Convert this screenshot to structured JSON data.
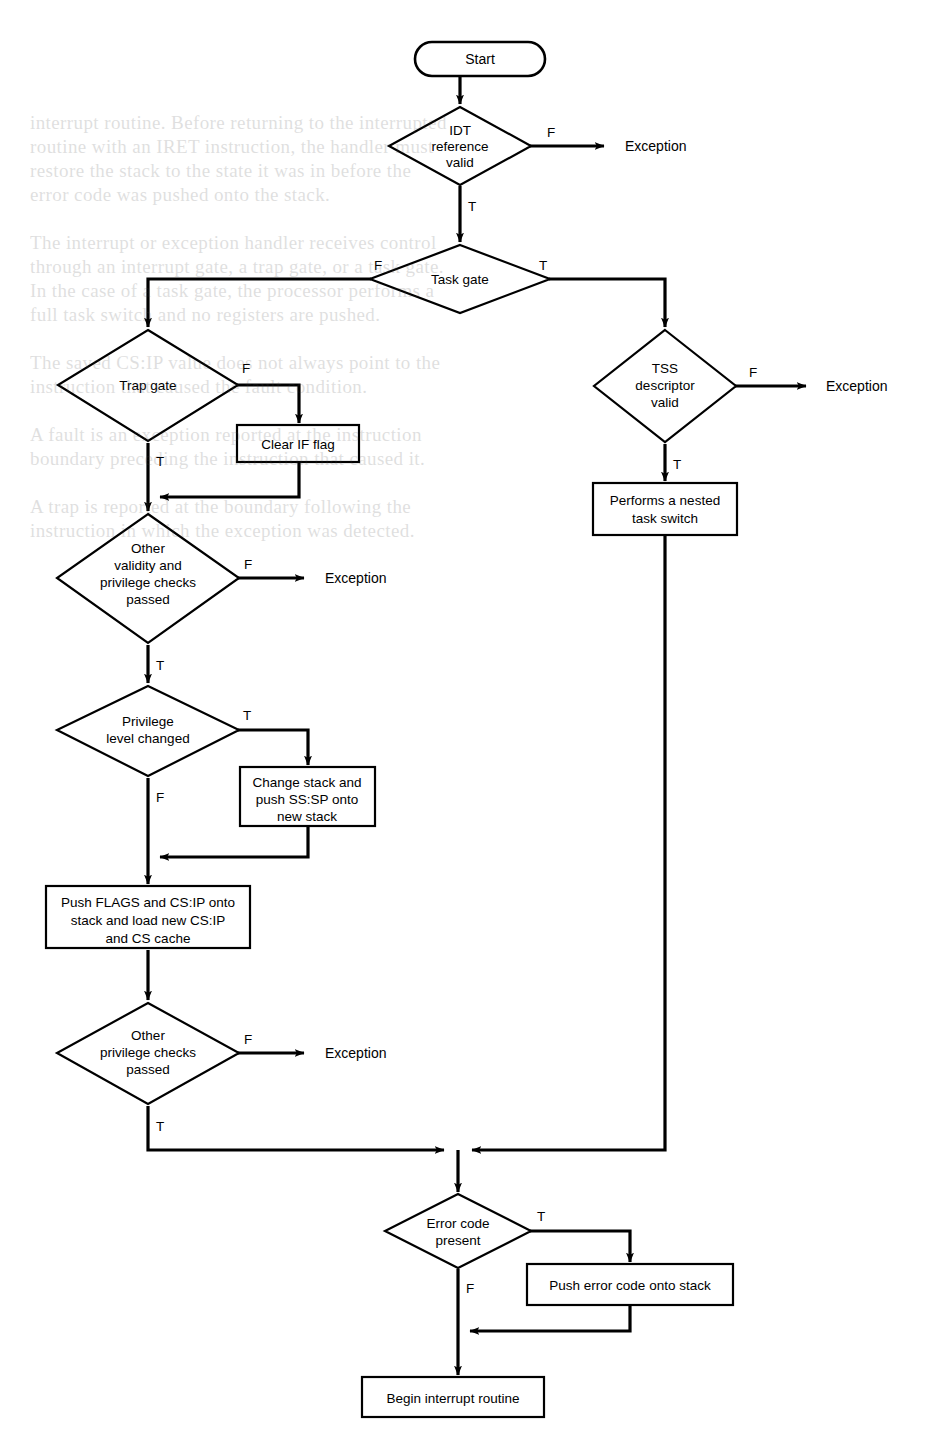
{
  "diagram": {
    "type": "flowchart",
    "nodes": {
      "start": {
        "id": "start",
        "shape": "terminator",
        "label": "Start"
      },
      "idt_ref_valid": {
        "id": "idt_ref_valid",
        "shape": "decision",
        "label_lines": [
          "IDT",
          "reference",
          "valid"
        ]
      },
      "exception_1": {
        "id": "exception_1",
        "shape": "text",
        "label": "Exception"
      },
      "task_gate": {
        "id": "task_gate",
        "shape": "decision",
        "label_lines": [
          "Task gate"
        ]
      },
      "tss_desc_valid": {
        "id": "tss_desc_valid",
        "shape": "decision",
        "label_lines": [
          "TSS",
          "descriptor",
          "valid"
        ]
      },
      "exception_2": {
        "id": "exception_2",
        "shape": "text",
        "label": "Exception"
      },
      "nested_task_switch": {
        "id": "nested_task_switch",
        "shape": "process",
        "label_lines": [
          "Performs a nested",
          "task switch"
        ]
      },
      "trap_gate": {
        "id": "trap_gate",
        "shape": "decision",
        "label_lines": [
          "Trap gate"
        ]
      },
      "clear_if_flag": {
        "id": "clear_if_flag",
        "shape": "process",
        "label_lines": [
          "Clear IF flag"
        ]
      },
      "other_validity_checks": {
        "id": "other_validity_checks",
        "shape": "decision",
        "label_lines": [
          "Other",
          "validity and",
          "privilege checks",
          "passed"
        ]
      },
      "exception_3": {
        "id": "exception_3",
        "shape": "text",
        "label": "Exception"
      },
      "privilege_level_changed": {
        "id": "privilege_level_changed",
        "shape": "decision",
        "label_lines": [
          "Privilege",
          "level changed"
        ]
      },
      "change_stack": {
        "id": "change_stack",
        "shape": "process",
        "label_lines": [
          "Change stack and",
          "push SS:SP onto",
          "new stack"
        ]
      },
      "push_flags": {
        "id": "push_flags",
        "shape": "process",
        "label_lines": [
          "Push FLAGS and CS:IP onto",
          "stack and load new CS:IP",
          "and CS cache"
        ]
      },
      "other_priv_checks": {
        "id": "other_priv_checks",
        "shape": "decision",
        "label_lines": [
          "Other",
          "privilege checks",
          "passed"
        ]
      },
      "exception_4": {
        "id": "exception_4",
        "shape": "text",
        "label": "Exception"
      },
      "error_code_present": {
        "id": "error_code_present",
        "shape": "decision",
        "label_lines": [
          "Error code",
          "present"
        ]
      },
      "push_error_code": {
        "id": "push_error_code",
        "shape": "process",
        "label_lines": [
          "Push error code onto stack"
        ]
      },
      "begin_interrupt_routine": {
        "id": "begin_interrupt_routine",
        "shape": "process",
        "label_lines": [
          "Begin interrupt routine"
        ]
      }
    },
    "edges": [
      {
        "from": "start",
        "to": "idt_ref_valid",
        "label": ""
      },
      {
        "from": "idt_ref_valid",
        "to": "exception_1",
        "label": "F"
      },
      {
        "from": "idt_ref_valid",
        "to": "task_gate",
        "label": "T"
      },
      {
        "from": "task_gate",
        "to": "trap_gate",
        "label": "F"
      },
      {
        "from": "task_gate",
        "to": "tss_desc_valid",
        "label": "T"
      },
      {
        "from": "tss_desc_valid",
        "to": "exception_2",
        "label": "F"
      },
      {
        "from": "tss_desc_valid",
        "to": "nested_task_switch",
        "label": "T"
      },
      {
        "from": "nested_task_switch",
        "to": "error_code_present",
        "label": ""
      },
      {
        "from": "trap_gate",
        "to": "clear_if_flag",
        "label": "F"
      },
      {
        "from": "trap_gate",
        "to": "other_validity_checks",
        "label": "T"
      },
      {
        "from": "clear_if_flag",
        "to": "other_validity_checks",
        "label": ""
      },
      {
        "from": "other_validity_checks",
        "to": "exception_3",
        "label": "F"
      },
      {
        "from": "other_validity_checks",
        "to": "privilege_level_changed",
        "label": "T"
      },
      {
        "from": "privilege_level_changed",
        "to": "change_stack",
        "label": "T"
      },
      {
        "from": "privilege_level_changed",
        "to": "push_flags",
        "label": "F"
      },
      {
        "from": "change_stack",
        "to": "push_flags",
        "label": ""
      },
      {
        "from": "push_flags",
        "to": "other_priv_checks",
        "label": ""
      },
      {
        "from": "other_priv_checks",
        "to": "exception_4",
        "label": "F"
      },
      {
        "from": "other_priv_checks",
        "to": "error_code_present",
        "label": "T"
      },
      {
        "from": "error_code_present",
        "to": "push_error_code",
        "label": "T"
      },
      {
        "from": "error_code_present",
        "to": "begin_interrupt_routine",
        "label": "F"
      },
      {
        "from": "push_error_code",
        "to": "begin_interrupt_routine",
        "label": ""
      }
    ],
    "edge_labels": {
      "f": "F",
      "t": "T"
    },
    "colors": {
      "stroke": "#000000",
      "fill": "#ffffff",
      "background": "#ffffff"
    }
  },
  "background_text": {
    "note": "Faint show-through text from the reverse side of the printed page",
    "lines": [
      "interrupt routine. Before returning to the interrupted routine",
      "with an IRET instruction, the handler must restore the stack",
      "to the state it was in before the error code was pushed.",
      "that generated the exception is not always the instruction",
      "that caused the fault condition."
    ]
  }
}
